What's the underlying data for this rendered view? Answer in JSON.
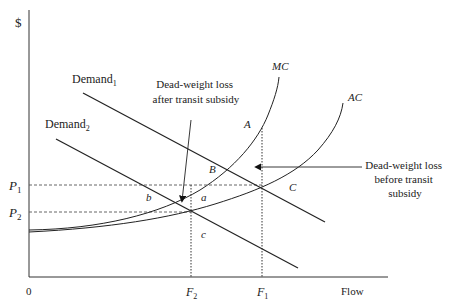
{
  "diagram": {
    "type": "economics-supply-demand",
    "y_axis_label": "$",
    "x_axis_label": "Flow",
    "origin_label": "0",
    "price_labels": {
      "p1": {
        "base": "P",
        "sub": "1"
      },
      "p2": {
        "base": "P",
        "sub": "2"
      }
    },
    "flow_labels": {
      "f2": {
        "base": "F",
        "sub": "2"
      },
      "f1": {
        "base": "F",
        "sub": "1"
      }
    },
    "curves": {
      "demand1": {
        "base": "Demand",
        "sub": "1"
      },
      "demand2": {
        "base": "Demand",
        "sub": "2"
      },
      "mc": "MC",
      "ac": "AC"
    },
    "points": {
      "A": "A",
      "B": "B",
      "C": "C",
      "a": "a",
      "b": "b",
      "c": "c"
    },
    "annotations": {
      "after": [
        "Dead-weight loss",
        "after transit subsidy"
      ],
      "before": [
        "Dead-weight loss",
        "before transit",
        "subsidy"
      ]
    },
    "colors": {
      "line": "#222222",
      "dashed": "#555555"
    }
  }
}
